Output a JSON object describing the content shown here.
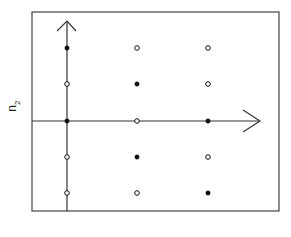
{
  "diagram": {
    "ylabel": "n",
    "ylabel_sub": "2",
    "frame": {
      "x1": 32,
      "y1": 12,
      "x2": 279,
      "y2": 211
    },
    "axes": {
      "vertical": {
        "x": 67,
        "y_top": 21,
        "y_bottom": 211
      },
      "horizontal": {
        "y": 121,
        "x_left": 32,
        "x_right": 260
      }
    },
    "columns_x": [
      67,
      137,
      208
    ],
    "rows_y": [
      48,
      84,
      121,
      157,
      193
    ],
    "points": [
      {
        "col": 0,
        "row": 0,
        "filled": true
      },
      {
        "col": 1,
        "row": 0,
        "filled": false
      },
      {
        "col": 2,
        "row": 0,
        "filled": false
      },
      {
        "col": 0,
        "row": 1,
        "filled": false
      },
      {
        "col": 1,
        "row": 1,
        "filled": true
      },
      {
        "col": 2,
        "row": 1,
        "filled": false
      },
      {
        "col": 0,
        "row": 2,
        "filled": true
      },
      {
        "col": 1,
        "row": 2,
        "filled": false
      },
      {
        "col": 2,
        "row": 2,
        "filled": true
      },
      {
        "col": 0,
        "row": 3,
        "filled": false
      },
      {
        "col": 1,
        "row": 3,
        "filled": true
      },
      {
        "col": 2,
        "row": 3,
        "filled": false
      },
      {
        "col": 0,
        "row": 4,
        "filled": false
      },
      {
        "col": 1,
        "row": 4,
        "filled": false
      },
      {
        "col": 2,
        "row": 4,
        "filled": true
      }
    ],
    "colors": {
      "line": "#333333",
      "point": "#111111",
      "background": "#ffffff"
    }
  }
}
